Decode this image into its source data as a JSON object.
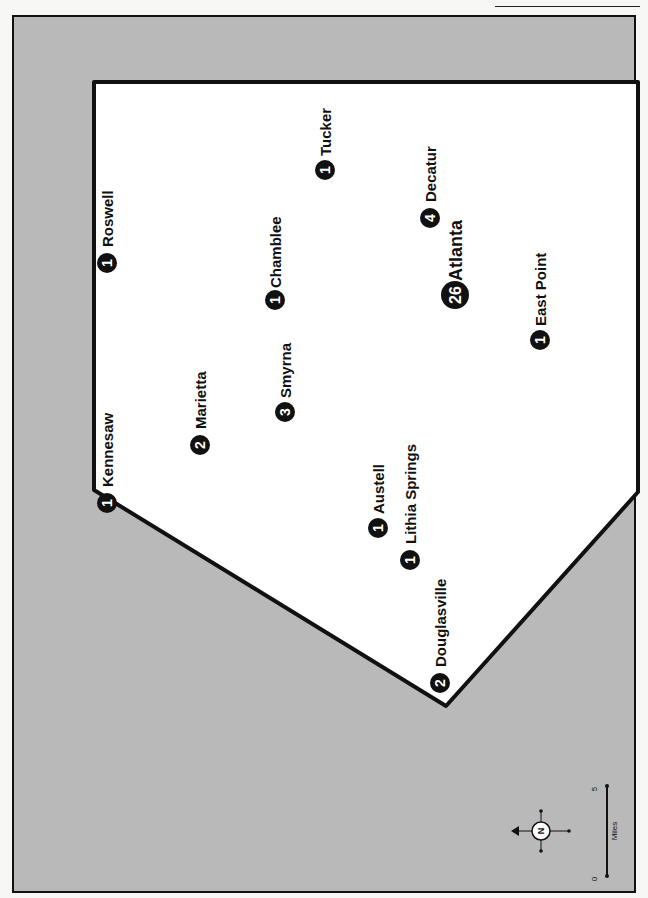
{
  "map": {
    "orientation": "rotated 90deg counter-clockwise (labels read bottom-to-top)",
    "background_color": "#b9b9b9",
    "region_fill": "#ffffff",
    "marker_color": "#111111",
    "cities": [
      {
        "name": "Roswell",
        "count": "1"
      },
      {
        "name": "Kennesaw",
        "count": "1"
      },
      {
        "name": "Marietta",
        "count": "2"
      },
      {
        "name": "Chamblee",
        "count": "1"
      },
      {
        "name": "Tucker",
        "count": "1"
      },
      {
        "name": "Decatur",
        "count": "4"
      },
      {
        "name": "Smyrna",
        "count": "3"
      },
      {
        "name": "Atlanta",
        "count": "26"
      },
      {
        "name": "East Point",
        "count": "1"
      },
      {
        "name": "Lithia Springs",
        "count": "1"
      },
      {
        "name": "Austell",
        "count": "1"
      },
      {
        "name": "Douglasville",
        "count": "2"
      }
    ]
  },
  "legend": {
    "compass_label": "N",
    "scale": {
      "start": "0",
      "end": "5",
      "unit": "Miles"
    }
  }
}
